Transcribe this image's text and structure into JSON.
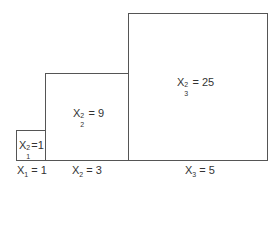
{
  "diagram": {
    "type": "area-squares",
    "squares": [
      {
        "id": 1,
        "var": "X",
        "index": "1",
        "side_value": "1",
        "area_value": "1",
        "side_label": "X1=1",
        "area_label": "X1^2=1"
      },
      {
        "id": 2,
        "var": "X",
        "index": "2",
        "side_value": "3",
        "area_value": "9",
        "side_label": "X2=3",
        "area_label": "X2^2=9"
      },
      {
        "id": 3,
        "var": "X",
        "index": "3",
        "side_value": "5",
        "area_value": "25",
        "side_label": "X3=5",
        "area_label": "X3^2=25"
      }
    ],
    "exponent": "2",
    "equals": "="
  }
}
